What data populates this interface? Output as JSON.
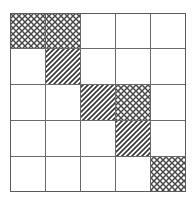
{
  "figure": {
    "name": "hatched-grid-diagram",
    "type": "grid",
    "rows": 5,
    "cols": 5,
    "cell_width": 35.2,
    "cell_height": 35.8,
    "origin_x": 10,
    "origin_y": 13,
    "width": 176,
    "height": 179
  },
  "style": {
    "background_color": "#ffffff",
    "grid_line_color": "#6a6a6a",
    "border_color": "#5a5a5a",
    "grid_line_width": 1,
    "border_width": 1.4,
    "hatch_color": "#3a3a3a",
    "crosshatch_color": "#4a4a4a",
    "empty_fill": "#ffffff"
  },
  "legend": {
    "patterns": [
      {
        "key": "empty",
        "label": "empty"
      },
      {
        "key": "crosshatch",
        "label": "cross-hatch"
      },
      {
        "key": "diagonal",
        "label": "diagonal-hatch"
      }
    ]
  },
  "chart_data": {
    "type": "heatmap",
    "title": "",
    "xlabel": "",
    "ylabel": "",
    "categories": [
      "0",
      "1",
      "2",
      "3",
      "4"
    ],
    "row_labels": [
      "0",
      "1",
      "2",
      "3",
      "4"
    ],
    "cells": [
      [
        "crosshatch",
        "crosshatch",
        "empty",
        "empty",
        "empty"
      ],
      [
        "empty",
        "diagonal",
        "empty",
        "empty",
        "empty"
      ],
      [
        "empty",
        "empty",
        "diagonal",
        "crosshatch",
        "empty"
      ],
      [
        "empty",
        "empty",
        "empty",
        "diagonal",
        "empty"
      ],
      [
        "empty",
        "empty",
        "empty",
        "empty",
        "crosshatch"
      ]
    ],
    "shaded_count": 7,
    "crosshatch_count": 4,
    "diagonal_count": 3,
    "empty_count": 18
  }
}
